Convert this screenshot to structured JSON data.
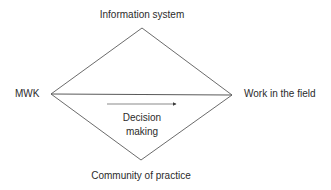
{
  "diagram": {
    "type": "diamond-with-horizontal-axis",
    "nodes": {
      "top": {
        "label": "Information system"
      },
      "bottom": {
        "label": "Community of practice"
      },
      "left": {
        "label": "MWK"
      },
      "right": {
        "label": "Work in the field"
      }
    },
    "center": {
      "line1": "Decision",
      "line2": "making",
      "arrow_direction": "left-to-right"
    },
    "colors": {
      "line": "#5a5a5a",
      "text": "#2b2b2b",
      "background": "#ffffff"
    }
  }
}
